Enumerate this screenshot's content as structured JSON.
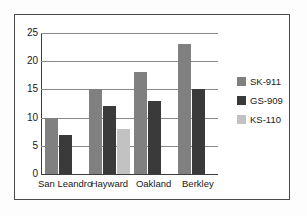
{
  "chart_data": {
    "type": "bar",
    "title": "",
    "xlabel": "",
    "ylabel": "",
    "categories": [
      "San Leandro",
      "Hayward",
      "Oakland",
      "Berkley"
    ],
    "series": [
      {
        "name": "SK-911",
        "color": "#808080",
        "values": [
          10,
          15,
          18,
          23
        ]
      },
      {
        "name": "GS-909",
        "color": "#3a3a3a",
        "values": [
          7,
          12,
          13,
          15
        ]
      },
      {
        "name": "KS-110",
        "color": "#c2c2c2",
        "values": [
          null,
          8,
          null,
          null
        ]
      }
    ],
    "ylim": [
      0,
      25
    ],
    "yticks": [
      0,
      5,
      10,
      15,
      20,
      25
    ],
    "ytick_labels": [
      "0",
      "5",
      "10",
      "15",
      "20",
      "25"
    ],
    "grid": true,
    "legend_position": "right"
  },
  "legend": {
    "items": [
      {
        "label": "SK-911",
        "color": "#808080"
      },
      {
        "label": "GS-909",
        "color": "#3a3a3a"
      },
      {
        "label": "KS-110",
        "color": "#c2c2c2"
      }
    ]
  }
}
